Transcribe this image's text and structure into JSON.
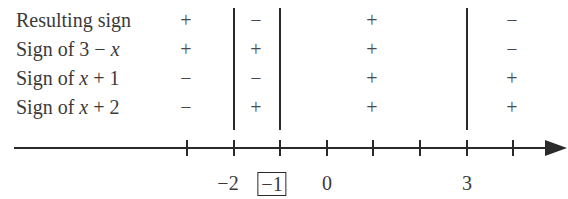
{
  "diagram": {
    "type": "sign-chart",
    "rows": [
      {
        "label_pre": "Resulting sign",
        "label_var": "",
        "label_post": "",
        "signs": [
          "+",
          "−",
          "+",
          "−"
        ]
      },
      {
        "label_pre": "Sign of 3 − ",
        "label_var": "x",
        "label_post": "",
        "signs": [
          "+",
          "+",
          "+",
          "−"
        ]
      },
      {
        "label_pre": "Sign of ",
        "label_var": "x",
        "label_post": " + 1",
        "signs": [
          "−",
          "−",
          "+",
          "+"
        ]
      },
      {
        "label_pre": "Sign of ",
        "label_var": "x",
        "label_post": " + 2",
        "signs": [
          "−",
          "+",
          "+",
          "+"
        ]
      }
    ],
    "critical_points": [
      "−2",
      "−1",
      "3"
    ],
    "axis_labels": [
      {
        "text": "−2",
        "boxed": false
      },
      {
        "text": "−1",
        "boxed": true
      },
      {
        "text": "0",
        "boxed": false
      },
      {
        "text": "3",
        "boxed": false
      }
    ],
    "tick_count": 8
  }
}
